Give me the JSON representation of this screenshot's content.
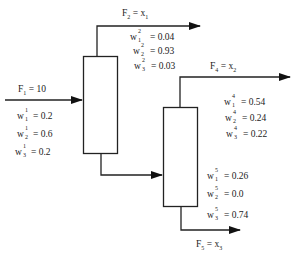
{
  "streams": {
    "F1": {
      "label": "F",
      "sub": "1",
      "rhs": "= 10",
      "fractions": [
        {
          "comp": "1",
          "stream": "1",
          "value": "= 0.2"
        },
        {
          "comp": "2",
          "stream": "1",
          "value": "= 0.6"
        },
        {
          "comp": "3",
          "stream": "1",
          "value": "= 0.2"
        }
      ]
    },
    "F2": {
      "label": "F",
      "sub": "2",
      "rhs": "= x",
      "rhs_sub": "1",
      "fractions": [
        {
          "comp": "1",
          "stream": "2",
          "value": "= 0.04"
        },
        {
          "comp": "2",
          "stream": "2",
          "value": "= 0.93"
        },
        {
          "comp": "3",
          "stream": "2",
          "value": "= 0.03"
        }
      ]
    },
    "F4": {
      "label": "F",
      "sub": "4",
      "rhs": "= x",
      "rhs_sub": "2",
      "fractions": [
        {
          "comp": "1",
          "stream": "4",
          "value": "= 0.54"
        },
        {
          "comp": "2",
          "stream": "4",
          "value": "= 0.24"
        },
        {
          "comp": "3",
          "stream": "4",
          "value": "= 0.22"
        }
      ]
    },
    "F5": {
      "label": "F",
      "sub": "5",
      "rhs": "= x",
      "rhs_sub": "3",
      "fractions": [
        {
          "comp": "1",
          "stream": "5",
          "value": "= 0.26"
        },
        {
          "comp": "2",
          "stream": "5",
          "value": "= 0.0"
        },
        {
          "comp": "3",
          "stream": "5",
          "value": "= 0.74"
        }
      ]
    }
  },
  "symbol": "w"
}
